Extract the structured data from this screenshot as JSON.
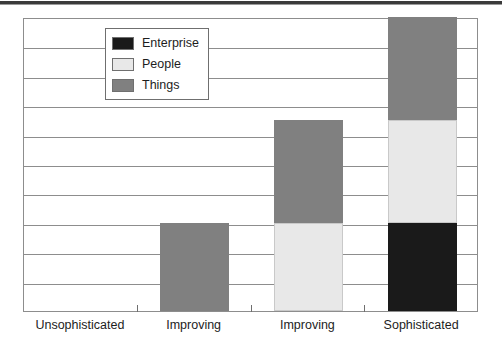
{
  "chart_data": {
    "type": "bar",
    "subtype": "stacked-column",
    "title": "",
    "xlabel": "",
    "ylabel": "",
    "categories": [
      "Unsophisticated",
      "Improving",
      "Improving",
      "Sophisticated"
    ],
    "series": [
      {
        "name": "Enterprise",
        "color": "#1a1a1a",
        "values": [
          0,
          0,
          0,
          3
        ]
      },
      {
        "name": "People",
        "color": "#e8e8e8",
        "values": [
          0,
          0,
          3,
          3.5
        ]
      },
      {
        "name": "Things",
        "color": "#808080",
        "values": [
          0,
          3,
          3.5,
          3.5
        ]
      }
    ],
    "stack_order_bottom_to_top": [
      "Enterprise",
      "People",
      "Things"
    ],
    "ylim": [
      0,
      10
    ],
    "y_gridline_count": 10,
    "y_tick_labels": [],
    "grid": true,
    "legend_position": "top-left-inside",
    "totals": [
      0,
      3,
      6.5,
      10
    ]
  },
  "legend": {
    "items": [
      {
        "label": "Enterprise",
        "color": "#1a1a1a"
      },
      {
        "label": "People",
        "color": "#e8e8e8"
      },
      {
        "label": "Things",
        "color": "#808080"
      }
    ]
  },
  "axis": {
    "categories": [
      "Unsophisticated",
      "Improving",
      "Improving",
      "Sophisticated"
    ]
  },
  "colors": {
    "enterprise": "#1a1a1a",
    "people": "#e8e8e8",
    "things": "#808080",
    "gridline": "#8d8d8d",
    "frame": "#8d8d8d",
    "top_rule": "#3a3a3a",
    "text": "#1d1d1d"
  }
}
